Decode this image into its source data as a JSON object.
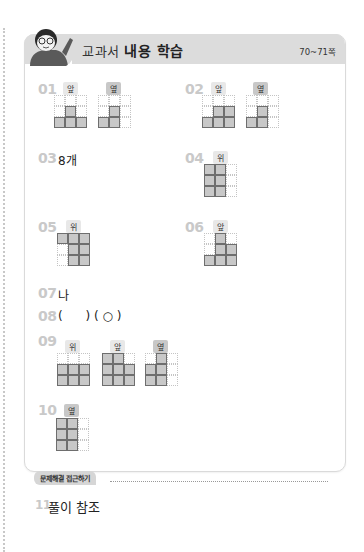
{
  "header": {
    "title_light": "교과서",
    "title_bold": "내용 학습",
    "pages": "70~71쪽"
  },
  "questions": [
    {
      "num": "01",
      "views": [
        {
          "label": "앞",
          "style": "light",
          "filled": [
            [
              0,
              0,
              0
            ],
            [
              0,
              1,
              0
            ],
            [
              1,
              1,
              1
            ]
          ]
        },
        {
          "label": "옆",
          "style": "dark",
          "filled": [
            [
              0,
              0,
              0
            ],
            [
              0,
              1,
              0
            ],
            [
              1,
              1,
              0
            ]
          ]
        }
      ]
    },
    {
      "num": "02",
      "views": [
        {
          "label": "앞",
          "style": "light",
          "filled": [
            [
              0,
              0,
              0
            ],
            [
              0,
              1,
              1
            ],
            [
              1,
              1,
              1
            ]
          ]
        },
        {
          "label": "옆",
          "style": "dark",
          "filled": [
            [
              0,
              0,
              0
            ],
            [
              0,
              1,
              0
            ],
            [
              1,
              1,
              0
            ]
          ]
        }
      ]
    },
    {
      "num": "03",
      "answer": "8개"
    },
    {
      "num": "04",
      "views": [
        {
          "label": "위",
          "style": "light",
          "filled": [
            [
              1,
              1,
              0
            ],
            [
              1,
              1,
              0
            ],
            [
              1,
              1,
              0
            ]
          ]
        }
      ]
    },
    {
      "num": "05",
      "views": [
        {
          "label": "위",
          "style": "light",
          "filled": [
            [
              1,
              1,
              1
            ],
            [
              0,
              1,
              1
            ],
            [
              0,
              1,
              1
            ]
          ]
        }
      ]
    },
    {
      "num": "06",
      "views": [
        {
          "label": "앞",
          "style": "light",
          "filled": [
            [
              0,
              1,
              0
            ],
            [
              0,
              1,
              1
            ],
            [
              1,
              1,
              1
            ]
          ]
        }
      ]
    },
    {
      "num": "07",
      "answer": "나"
    },
    {
      "num": "08",
      "answer": "(      ) ( ○ )"
    },
    {
      "num": "09",
      "views": [
        {
          "label": "위",
          "style": "light",
          "filled": [
            [
              0,
              0,
              0
            ],
            [
              1,
              1,
              1
            ],
            [
              1,
              1,
              1
            ]
          ]
        },
        {
          "label": "앞",
          "style": "light",
          "filled": [
            [
              1,
              1,
              0
            ],
            [
              1,
              1,
              1
            ],
            [
              1,
              1,
              1
            ]
          ]
        },
        {
          "label": "옆",
          "style": "dark",
          "filled": [
            [
              0,
              1,
              0
            ],
            [
              1,
              1,
              0
            ],
            [
              1,
              1,
              0
            ]
          ]
        }
      ]
    },
    {
      "num": "10",
      "views": [
        {
          "label": "옆",
          "style": "dark",
          "filled": [
            [
              1,
              1,
              0
            ],
            [
              1,
              1,
              0
            ],
            [
              1,
              1,
              0
            ]
          ]
        }
      ]
    },
    {
      "num": "11",
      "answer": "풀이 참조"
    }
  ],
  "section": {
    "label": "문제해결 접근하기"
  }
}
